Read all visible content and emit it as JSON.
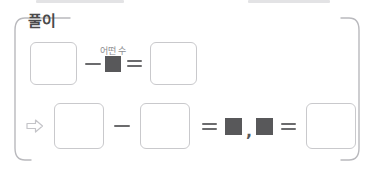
{
  "panel": {
    "title": "풀이",
    "border_color": "#b9b9bd",
    "box_border_color": "#c9c9cc",
    "unknown_square_color": "#58585a",
    "operator_color": "#6b6b6d"
  },
  "equations": [
    {
      "id": "equation-line-1",
      "arrow": "",
      "unknown_label": "어떤 수",
      "tokens": [
        {
          "type": "blank-box",
          "value": ""
        },
        {
          "type": "operator",
          "value": "−",
          "name": "minus"
        },
        {
          "type": "unknown-square",
          "value": ""
        },
        {
          "type": "operator",
          "value": "=",
          "name": "equals"
        },
        {
          "type": "blank-box",
          "value": ""
        }
      ]
    },
    {
      "id": "equation-line-2",
      "arrow": "⇨",
      "unknown_label": "",
      "tokens": [
        {
          "type": "blank-box",
          "value": ""
        },
        {
          "type": "operator",
          "value": "−",
          "name": "minus"
        },
        {
          "type": "blank-box",
          "value": ""
        },
        {
          "type": "operator",
          "value": "=",
          "name": "equals"
        },
        {
          "type": "unknown-square",
          "value": ""
        },
        {
          "type": "operator",
          "value": ",",
          "name": "comma"
        },
        {
          "type": "unknown-square",
          "value": ""
        },
        {
          "type": "operator",
          "value": "=",
          "name": "equals"
        },
        {
          "type": "blank-box",
          "value": ""
        }
      ]
    }
  ],
  "top_fragments": {
    "left": "",
    "right": ""
  }
}
